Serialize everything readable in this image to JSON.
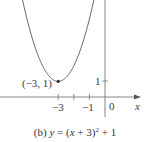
{
  "chart_data": {
    "type": "line",
    "function": "y = (x + 3)^2 + 1",
    "xlabel": "x",
    "ylabel": "",
    "x_ticks": [
      -3,
      -2,
      -1
    ],
    "x_tick_labels": [
      "-3",
      "-1"
    ],
    "y_ticks": [
      1
    ],
    "y_tick_labels": [
      "1"
    ],
    "origin_label": "0",
    "annotations": [
      {
        "point": [
          -3,
          1
        ],
        "label": "(−3, 1)"
      }
    ],
    "x": [
      -5.3,
      -5,
      -4.5,
      -4,
      -3.5,
      -3,
      -2.5,
      -2,
      -1.5,
      -1,
      -0.7
    ],
    "y": [
      6.29,
      5,
      3.25,
      2,
      1.25,
      1,
      1.25,
      2,
      3.25,
      5,
      6.29
    ],
    "grid": false,
    "legend": null
  },
  "labels": {
    "vertex": "(−3, 1)",
    "tick_neg3": "−3",
    "tick_neg1": "−1",
    "origin": "0",
    "x_axis": "x",
    "y_tick_1": "1",
    "caption_prefix": "(b) ",
    "caption_y": "y",
    "caption_eq": " = (",
    "caption_x": "x",
    "caption_plus3": " + 3)",
    "caption_exp": "2",
    "caption_tail": " + 1"
  },
  "colors": {
    "curve": "#555555",
    "axis": "#777777",
    "point": "#333333"
  }
}
